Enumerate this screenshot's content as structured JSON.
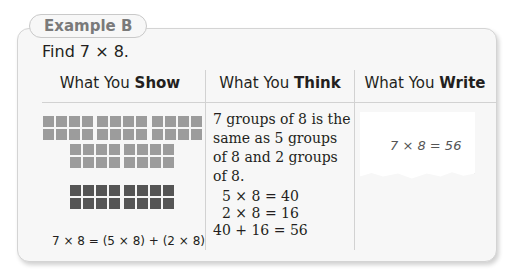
{
  "example": {
    "tab_label": "Example B",
    "prompt": "Find 7 × 8."
  },
  "columns": [
    {
      "prefix": "What You ",
      "bold": "Show"
    },
    {
      "prefix": "What You ",
      "bold": "Think"
    },
    {
      "prefix": "What You ",
      "bold": "Write"
    }
  ],
  "show": {
    "equation": "7 × 8 = (5 × 8) + (2 × 8)",
    "light_groups": 5,
    "dark_groups": 2
  },
  "think": {
    "text": "7 groups of 8 is the same as 5 groups of 8 and 2 groups of 8.",
    "lines": [
      "5 × 8   = 40",
      "2 × 8   = 16",
      "40 + 16 = 56"
    ]
  },
  "write": {
    "answer": "7 × 8 = 56"
  },
  "colors": {
    "light_square": "#9c9c9c",
    "dark_square": "#555555",
    "border": "#d2d2d2"
  }
}
